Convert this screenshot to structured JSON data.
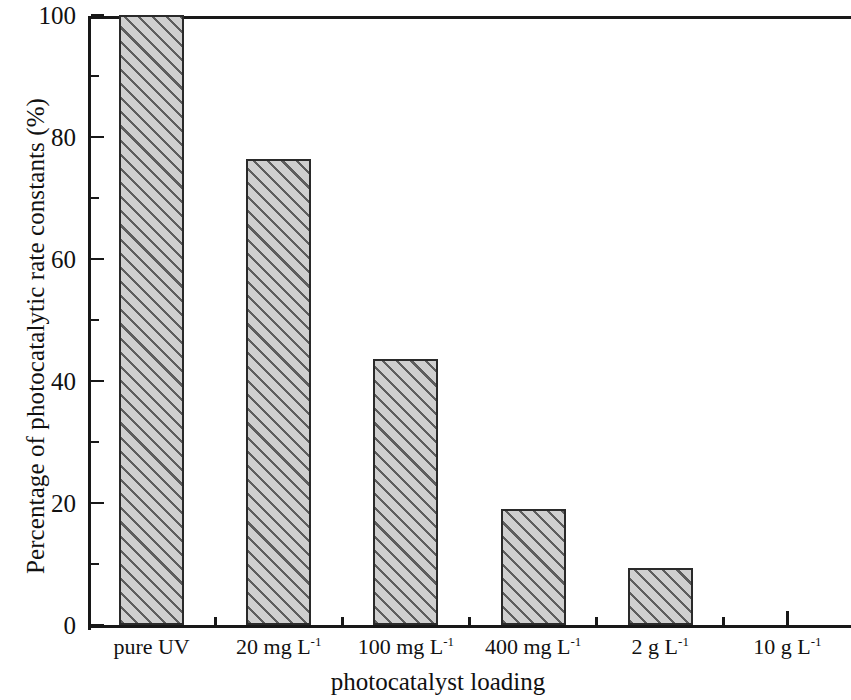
{
  "chart_data": {
    "type": "bar",
    "title": "",
    "subtitle": "",
    "xlabel": "photocatalyst loading",
    "ylabel": "Percentage of photocatalytic rate constants (%)",
    "categories": [
      "pure UV",
      "20 mg L⁻¹",
      "100 mg L⁻¹",
      "400 mg L⁻¹",
      "2 g L⁻¹",
      "10 g L⁻¹"
    ],
    "category_parts": [
      {
        "base": "pure UV",
        "sup": ""
      },
      {
        "base": "20 mg L",
        "sup": "-1"
      },
      {
        "base": "100 mg L",
        "sup": "-1"
      },
      {
        "base": "400 mg L",
        "sup": "-1"
      },
      {
        "base": "2 g L",
        "sup": "-1"
      },
      {
        "base": "10 g L",
        "sup": "-1"
      }
    ],
    "values": [
      100,
      76.4,
      43.6,
      19.0,
      9.3,
      0
    ],
    "ylim": [
      0,
      100
    ],
    "ytick_major": [
      0,
      20,
      40,
      60,
      80,
      100
    ],
    "ytick_major_labels": [
      "0",
      "20",
      "40",
      "60",
      "80",
      "100"
    ],
    "ytick_minor": [
      10,
      30,
      50,
      70,
      90
    ],
    "grid": false,
    "legend": null,
    "bar_fill_color": "#cfcfcf",
    "bar_hatch": "forward-diagonal",
    "bar_edge_color": "#2a2a2a",
    "axis_color": "#181818"
  }
}
